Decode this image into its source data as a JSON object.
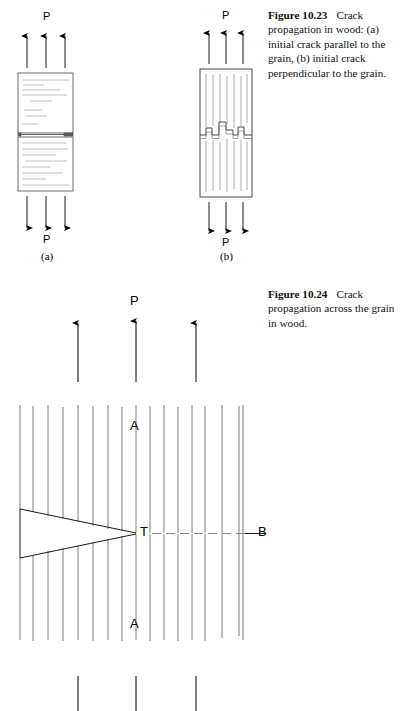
{
  "page": {
    "width": 407,
    "height": 711,
    "background": "#ffffff",
    "ink": "#000000"
  },
  "captions": {
    "fig_10_23": {
      "number": "Figure 10.23",
      "text": "Crack propagation in wood: (a) initial crack parallel to the grain, (b) initial crack perpendicular to the grain.",
      "line1": "Crack",
      "line2": "propagation in wood:",
      "line3": "(a) initial crack parallel to",
      "line4": "the grain, (b) initial crack",
      "line5": "perpendicular to the grain."
    },
    "fig_10_24": {
      "number": "Figure 10.24",
      "text": "Crack propagation across the grain in wood.",
      "line1": "Crack",
      "line2": "propagation across the",
      "line3": "grain in wood."
    }
  },
  "figure_a": {
    "name": "initial-crack-parallel-to-grain",
    "sublabel": "(a)",
    "load_top_label": "P",
    "load_bottom_label": "P",
    "arrow_count_top": 3,
    "arrow_count_bottom": 3,
    "specimen": {
      "x": 18,
      "y": 73,
      "width": 55,
      "height": 118,
      "crack_y": 135,
      "crack_orientation": "horizontal",
      "grain_orientation": "horizontal"
    }
  },
  "figure_b": {
    "name": "initial-crack-perpendicular-to-grain",
    "sublabel": "(b)",
    "load_top_label": "P",
    "load_bottom_label": "P",
    "arrow_count_top": 3,
    "arrow_count_bottom": 3,
    "specimen": {
      "x": 200,
      "y": 69,
      "width": 52,
      "height": 128,
      "crack_y": 134,
      "crack_orientation": "stepped-zigzag",
      "grain_orientation": "vertical"
    }
  },
  "figure_c": {
    "name": "crack-propagation-across-grain",
    "load_top_label": "P",
    "arrow_count_top": 3,
    "arrow_count_bottom": 3,
    "axis_label_top": "A",
    "axis_label_bottom": "A",
    "crack_tip_label": "T",
    "far_field_label": "B",
    "specimen": {
      "x": 20,
      "y": 405,
      "width": 225,
      "height": 237,
      "grain_orientation": "vertical",
      "notch_tip_x": 136,
      "notch_tip_y": 533
    },
    "dashed_line": {
      "from": "T",
      "to": "B"
    }
  }
}
